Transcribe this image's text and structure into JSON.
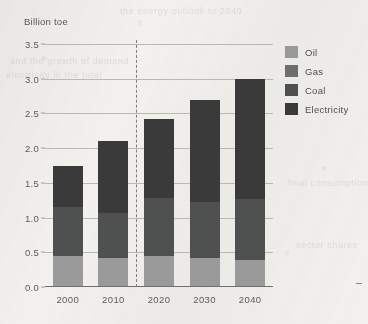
{
  "chart_data": {
    "type": "bar",
    "stacked": true,
    "title": "",
    "ylabel": "Billion toe",
    "xlabel": "",
    "categories": [
      "2000",
      "2010",
      "2020",
      "2030",
      "2040"
    ],
    "series": [
      {
        "name": "Oil",
        "color": "#9a9a9a",
        "values": [
          0.45,
          0.42,
          0.45,
          0.42,
          0.39
        ]
      },
      {
        "name": "Gas",
        "color": "#6e6e6e",
        "values": [
          0.0,
          0.0,
          0.0,
          0.0,
          0.0
        ]
      },
      {
        "name": "Coal",
        "color": "#4f5050",
        "values": [
          0.7,
          0.65,
          0.83,
          0.8,
          0.88
        ]
      },
      {
        "name": "Electricity",
        "color": "#3a3a3a",
        "values": [
          0.6,
          1.03,
          1.14,
          1.48,
          1.73
        ]
      }
    ],
    "totals": [
      1.75,
      2.1,
      2.42,
      2.7,
      3.0
    ],
    "ylim": [
      0.0,
      3.5
    ],
    "ytick_values": [
      0.0,
      0.5,
      1.0,
      1.5,
      2.0,
      2.5,
      3.0,
      3.5
    ],
    "ytick_labels": [
      "0.0",
      "0.5",
      "1.0",
      "1.5",
      "2.0",
      "2.5",
      "3.0",
      "3.5"
    ],
    "grid": true,
    "legend_position": "right",
    "annotations": [
      {
        "name": "history-forecast-divider",
        "type": "vertical-dashed-line",
        "between": [
          "2010",
          "2020"
        ]
      }
    ]
  },
  "legend": {
    "items": [
      {
        "label": "Oil",
        "color": "#9a9a9a"
      },
      {
        "label": "Gas",
        "color": "#6e6e6e"
      },
      {
        "label": "Coal",
        "color": "#4f5050"
      },
      {
        "label": "Electricity",
        "color": "#3a3a3a"
      }
    ]
  },
  "ghost_text": {
    "lines": [
      "the energy outlook to 2040",
      "and the growth of demand",
      "electricity in the total",
      "final consumption",
      "sector shares"
    ]
  }
}
